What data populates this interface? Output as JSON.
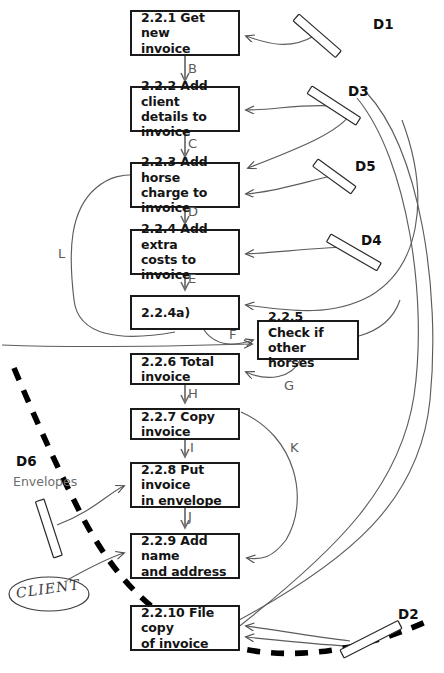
{
  "diagram": {
    "type": "data-flow-diagram",
    "canvas": {
      "width": 444,
      "height": 673
    },
    "colors": {
      "box_border": "#1a1a1a",
      "flow_line": "#4a4a4a",
      "boundary_line": "#000000",
      "label_text": "#141414",
      "edge_letter": "#5a5a5a",
      "sublabel": "#6d6d6d"
    },
    "processes": [
      {
        "id": "p1",
        "label": "2.2.1 Get new\ninvoice",
        "x": 130,
        "y": 10,
        "w": 110,
        "h": 46
      },
      {
        "id": "p2",
        "label": "2.2.2 Add client\ndetails to invoice",
        "x": 130,
        "y": 86,
        "w": 110,
        "h": 46
      },
      {
        "id": "p3",
        "label": "2.2.3 Add horse\ncharge to invoice",
        "x": 130,
        "y": 162,
        "w": 110,
        "h": 46
      },
      {
        "id": "p4",
        "label": "2.2.4 Add extra\ncosts to invoice",
        "x": 130,
        "y": 229,
        "w": 110,
        "h": 46
      },
      {
        "id": "p4a",
        "label": "2.2.4a)",
        "x": 130,
        "y": 295,
        "w": 110,
        "h": 35
      },
      {
        "id": "p5",
        "label": "2.2.5 Check if\nother horses",
        "x": 257,
        "y": 320,
        "w": 102,
        "h": 40
      },
      {
        "id": "p6",
        "label": "2.2.6 Total invoice",
        "x": 130,
        "y": 353,
        "w": 110,
        "h": 32
      },
      {
        "id": "p7",
        "label": "2.2.7 Copy invoice",
        "x": 130,
        "y": 408,
        "w": 110,
        "h": 32
      },
      {
        "id": "p8",
        "label": "2.2.8 Put invoice\nin envelope",
        "x": 130,
        "y": 462,
        "w": 110,
        "h": 46
      },
      {
        "id": "p9",
        "label": "2.2.9 Add name\nand address",
        "x": 130,
        "y": 533,
        "w": 110,
        "h": 46
      },
      {
        "id": "p10",
        "label": "2.2.10 File copy\nof invoice",
        "x": 130,
        "y": 605,
        "w": 110,
        "h": 46
      }
    ],
    "data_stores": [
      {
        "id": "d1",
        "label": "D1",
        "label_x": 373,
        "label_y": 16,
        "bar": {
          "x1": 299,
          "y1": 17,
          "x2": 341,
          "y2": 53
        }
      },
      {
        "id": "d3",
        "label": "D3",
        "label_x": 348,
        "label_y": 83,
        "bar": {
          "x1": 312,
          "y1": 88,
          "x2": 358,
          "y2": 120
        }
      },
      {
        "id": "d5",
        "label": "D5",
        "label_x": 355,
        "label_y": 158,
        "bar": {
          "x1": 318,
          "y1": 161,
          "x2": 352,
          "y2": 192
        }
      },
      {
        "id": "d4",
        "label": "D4",
        "label_x": 361,
        "label_y": 232,
        "bar": {
          "x1": 330,
          "y1": 237,
          "x2": 379,
          "y2": 270
        }
      },
      {
        "id": "d6",
        "label": "D6",
        "sublabel": "Envelopes",
        "label_x": 16,
        "label_y": 453,
        "sublabel_x": 13,
        "sublabel_y": 474,
        "bar": {
          "x1": 38,
          "y1": 501,
          "x2": 68,
          "y2": 551
        }
      },
      {
        "id": "d2",
        "label": "D2",
        "label_x": 398,
        "label_y": 606,
        "bar": {
          "x1": 340,
          "y1": 648,
          "x2": 395,
          "y2": 622
        }
      }
    ],
    "external_entities": [
      {
        "id": "client",
        "label": "CLIENT",
        "x": 10,
        "y": 578,
        "w": 79,
        "h": 33
      }
    ],
    "flow_letters": [
      {
        "id": "B",
        "label": "B",
        "x": 188,
        "y": 61
      },
      {
        "id": "C",
        "label": "C",
        "x": 188,
        "y": 137
      },
      {
        "id": "D",
        "label": "D",
        "x": 188,
        "y": 204
      },
      {
        "id": "E",
        "label": "E",
        "x": 188,
        "y": 271
      },
      {
        "id": "F",
        "label": "F",
        "x": 229,
        "y": 327
      },
      {
        "id": "G",
        "label": "G",
        "x": 284,
        "y": 381
      },
      {
        "id": "H",
        "label": "H",
        "x": 188,
        "y": 387
      },
      {
        "id": "I",
        "label": "I",
        "x": 188,
        "y": 441
      },
      {
        "id": "J",
        "label": "J",
        "x": 188,
        "y": 509
      },
      {
        "id": "K",
        "label": "K",
        "x": 290,
        "y": 442
      },
      {
        "id": "L",
        "label": "L",
        "x": 58,
        "y": 246
      }
    ]
  }
}
